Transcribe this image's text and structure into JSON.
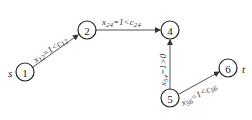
{
  "diagram": {
    "type": "flow-network",
    "nodes": [
      {
        "id": "1",
        "label": "1",
        "side_label": "s",
        "x": 25,
        "y": 72
      },
      {
        "id": "2",
        "label": "2",
        "side_label": "",
        "x": 87,
        "y": 30
      },
      {
        "id": "4",
        "label": "4",
        "side_label": "",
        "x": 170,
        "y": 30
      },
      {
        "id": "5",
        "label": "5",
        "side_label": "",
        "x": 170,
        "y": 98
      },
      {
        "id": "6",
        "label": "6",
        "side_label": "t",
        "x": 228,
        "y": 68
      }
    ],
    "edges": [
      {
        "from": "1",
        "to": "2",
        "label": "x12=1<c12"
      },
      {
        "from": "2",
        "to": "4",
        "label": "x24=1<c24"
      },
      {
        "from": "5",
        "to": "4",
        "label": "x54=1>0"
      },
      {
        "from": "5",
        "to": "6",
        "label": "x56=1<c56"
      }
    ],
    "colors": {
      "stroke": "#222222",
      "edge": "#555555",
      "background": "#ffffff"
    }
  }
}
